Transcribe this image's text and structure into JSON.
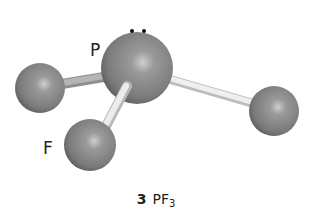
{
  "figure": {
    "molecule": "PF3",
    "type": "ball-and-stick",
    "central_atom": {
      "symbol": "P",
      "label": "P",
      "lone_pair": true
    },
    "terminal_atoms": [
      {
        "symbol": "F",
        "position": "left"
      },
      {
        "symbol": "F",
        "position": "front-bottom",
        "label": "F"
      },
      {
        "symbol": "F",
        "position": "right"
      }
    ],
    "colors": {
      "atom": "#8a8a8a",
      "atom_highlight": "#c8c8c8",
      "atom_shadow": "#5a5a5a",
      "bond": "#d8d8d8",
      "lone_pair_dot": "#111111"
    }
  },
  "labels": {
    "central": "P",
    "terminal": "F"
  },
  "caption": {
    "number": "3",
    "formula_main": "PF",
    "formula_sub": "3"
  }
}
